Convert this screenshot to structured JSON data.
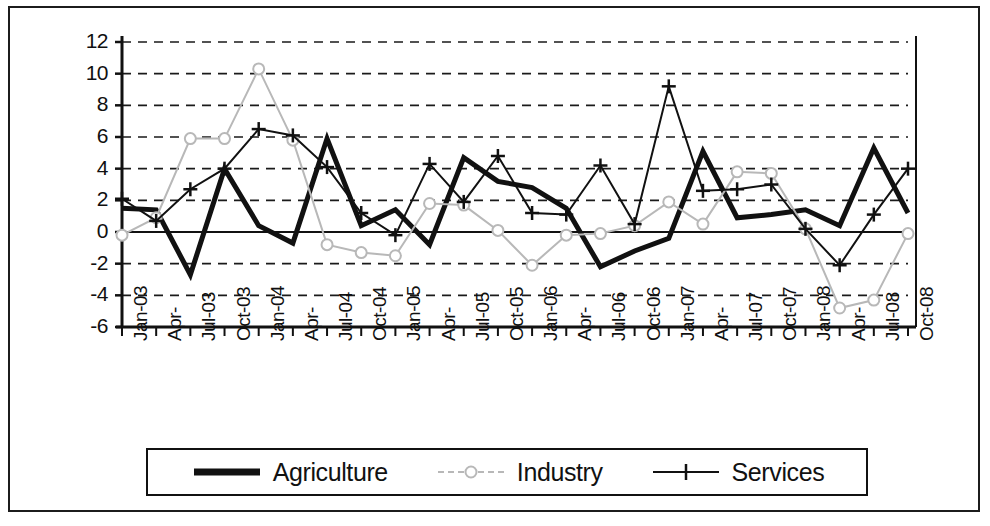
{
  "chart_data": {
    "type": "line",
    "title": "",
    "xlabel": "",
    "ylabel": "",
    "ylim": [
      -6,
      12
    ],
    "ytick_step": 2,
    "yticks": [
      "12",
      "10",
      "8",
      "6",
      "4",
      "2",
      "0",
      "-2",
      "-4",
      "-6"
    ],
    "grid": true,
    "grid_style": "dashed-horizontal",
    "legend_position": "bottom",
    "categories": [
      "Jan-03",
      "Apr-",
      "Jul-03",
      "Oct-03",
      "Jan-04",
      "Apr-",
      "Jul-04",
      "Oct-04",
      "Jan-05",
      "Apr-",
      "Jul-05",
      "Oct-05",
      "Jan-06",
      "Apr-",
      "Jul-06",
      "Oct-06",
      "Jan-07",
      "Apr-",
      "Jul-07",
      "Oct-07",
      "Jan-08",
      "Apr-",
      "Jul-08",
      "Oct-08"
    ],
    "series": [
      {
        "name": "Agriculture",
        "color": "#111111",
        "marker": "none",
        "width": 5,
        "values": [
          1.5,
          1.4,
          -2.7,
          4.0,
          0.4,
          -0.7,
          5.9,
          0.4,
          1.4,
          -0.8,
          4.7,
          3.2,
          2.8,
          1.5,
          -2.2,
          -1.2,
          -0.4,
          5.1,
          0.9,
          1.1,
          1.4,
          0.4,
          5.3,
          1.2
        ]
      },
      {
        "name": "Industry",
        "color": "#b8b8b8",
        "marker": "circle",
        "width": 2,
        "values": [
          -0.2,
          0.9,
          5.9,
          5.9,
          10.3,
          5.8,
          -0.8,
          -1.3,
          -1.5,
          1.8,
          1.7,
          0.1,
          -2.1,
          -0.2,
          -0.1,
          0.4,
          1.9,
          0.5,
          3.8,
          3.7,
          0.2,
          -4.8,
          -4.3,
          -0.1
        ]
      },
      {
        "name": "Services",
        "color": "#111111",
        "marker": "plus",
        "width": 2,
        "values": [
          2.1,
          0.7,
          2.7,
          4.0,
          6.5,
          6.1,
          4.1,
          1.2,
          -0.2,
          4.3,
          1.9,
          4.8,
          1.2,
          1.1,
          4.2,
          0.5,
          9.2,
          2.6,
          2.7,
          3.0,
          0.2,
          -2.1,
          1.1,
          4.0
        ]
      }
    ]
  },
  "legend": {
    "items": [
      {
        "label": "Agriculture"
      },
      {
        "label": "Industry"
      },
      {
        "label": "Services"
      }
    ]
  }
}
